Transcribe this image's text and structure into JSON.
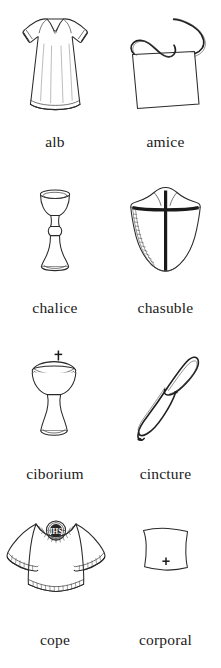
{
  "page": {
    "kind": "illustrated-glossary",
    "columns": 2,
    "rows": 4,
    "background_color": "#ffffff",
    "ink_color": "#2a2a2a",
    "caption_color": "#1b1b1b"
  },
  "entries": [
    {
      "id": "alb",
      "label": "alb",
      "icon_name": "alb-illustration",
      "description": "long white ankle-length tunic with wide sleeves and hem band"
    },
    {
      "id": "amice",
      "label": "amice",
      "icon_name": "amice-illustration",
      "description": "rectangular cloth with two long tying cords at the top"
    },
    {
      "id": "chalice",
      "label": "chalice",
      "icon_name": "chalice-illustration",
      "description": "footed cup with knopped stem and flared base"
    },
    {
      "id": "chasuble",
      "label": "chasuble",
      "icon_name": "chasuble-illustration",
      "description": "shield-shaped outer vestment with heavy cross orphrey"
    },
    {
      "id": "ciborium",
      "label": "ciborium",
      "icon_name": "ciborium-illustration",
      "description": "covered stemmed vessel with a small cross on the lid"
    },
    {
      "id": "cincture",
      "label": "cincture",
      "icon_name": "cincture-illustration",
      "description": "long knotted rope cord looped in a figure-eight"
    },
    {
      "id": "cope",
      "label": "cope",
      "icon_name": "cope-illustration",
      "description": "wide draped cape with embroidered IHS medallion and hem bands"
    },
    {
      "id": "corporal",
      "label": "corporal",
      "icon_name": "corporal-illustration",
      "description": "small square linen cloth marked with a cross"
    }
  ]
}
